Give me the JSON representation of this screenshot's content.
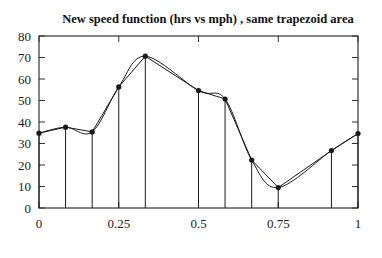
{
  "chart_data": {
    "type": "line",
    "title": "New speed function (hrs vs mph) , same trapezoid area",
    "xlabel": "",
    "ylabel": "",
    "xlim": [
      0,
      1
    ],
    "ylim": [
      0,
      80
    ],
    "x_ticks": [
      0,
      0.25,
      0.5,
      0.75,
      1
    ],
    "x_tick_labels": [
      "0",
      "0.25",
      "0.5",
      "0.75",
      "1"
    ],
    "y_ticks": [
      0,
      10,
      20,
      30,
      40,
      50,
      60,
      70,
      80
    ],
    "y_tick_labels": [
      "0",
      "10",
      "20",
      "30",
      "40",
      "50",
      "60",
      "70",
      "80"
    ],
    "grid": false,
    "legend": null,
    "series": [
      {
        "name": "sample points (trapezoid polyline)",
        "style": "straight-lines-with-markers-and-vertical-drops",
        "x": [
          0,
          0.0833,
          0.1667,
          0.25,
          0.3333,
          0.5,
          0.5833,
          0.6667,
          0.75,
          0.9167,
          1
        ],
        "values": [
          34.8,
          37.6,
          35.4,
          56.3,
          70.6,
          54.6,
          50.7,
          22.3,
          9.5,
          26.7,
          34.6
        ]
      },
      {
        "name": "smooth speed curve",
        "style": "smooth-curve",
        "x": [
          0,
          0.0833,
          0.1667,
          0.25,
          0.3333,
          0.5,
          0.5833,
          0.6667,
          0.75,
          0.9167,
          1
        ],
        "values": [
          34.8,
          37.6,
          35.4,
          56.3,
          70.6,
          54.6,
          50.7,
          22.3,
          9.5,
          26.7,
          34.6
        ]
      }
    ]
  },
  "colors": {
    "line": "#1a1a1a",
    "axis": "#333333",
    "background": "#ffffff"
  }
}
